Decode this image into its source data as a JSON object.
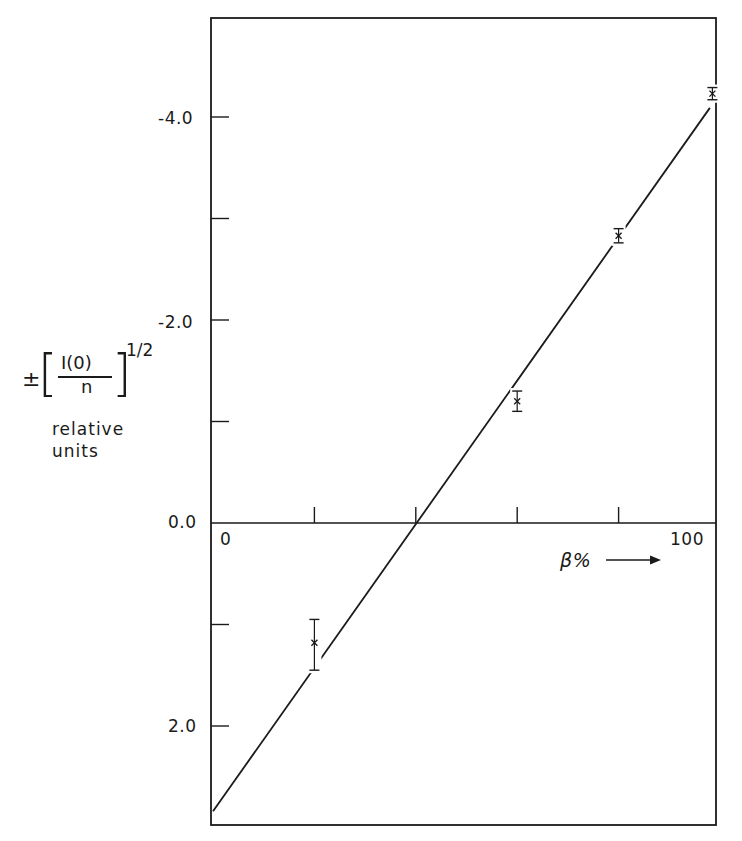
{
  "chart_data": {
    "type": "scatter",
    "title": "",
    "xlabel": "β%",
    "ylabel": "±[I(0)/n]^1/2 relative units",
    "xlim": [
      0,
      100
    ],
    "ylim": [
      2.97,
      -4.97
    ],
    "y_axis_inverted": true,
    "grid": false,
    "x_ticks": [
      0,
      20,
      40,
      60,
      80,
      100
    ],
    "x_tick_labels": {
      "0": "0",
      "100": "100"
    },
    "y_ticks": [
      -4.0,
      -3.0,
      -2.0,
      -1.0,
      0.0,
      1.0,
      2.0
    ],
    "y_tick_labels": [
      "-4.0",
      "-2.0",
      "0.0",
      "2.0"
    ],
    "series": [
      {
        "name": "measured points",
        "kind": "scatter_errorbar",
        "marker": "x",
        "x": [
          20,
          60,
          80,
          98.5
        ],
        "y": [
          1.18,
          -1.2,
          -2.83,
          -4.23
        ],
        "y_err_low": [
          0.95,
          -1.3,
          -2.9,
          -4.29
        ],
        "y_err_high": [
          1.45,
          -1.1,
          -2.76,
          -4.17
        ]
      },
      {
        "name": "fitted line",
        "kind": "line",
        "x": [
          0,
          98
        ],
        "y": [
          2.84,
          -4.09
        ]
      }
    ],
    "annotations": [
      "β% →"
    ]
  },
  "axis": {
    "y_tick_labels": [
      "-4.0",
      "-2.0",
      "0.0",
      "2.0"
    ],
    "x_label_start": "0",
    "x_label_end": "100",
    "x_title": "β% ⟶"
  },
  "ylabel": {
    "pm": "±",
    "left_bracket": "[",
    "right_bracket": "]",
    "numerator": "I(0)",
    "denominator": "n",
    "power": "1/2",
    "units_line1": "relative",
    "units_line2": "units"
  }
}
